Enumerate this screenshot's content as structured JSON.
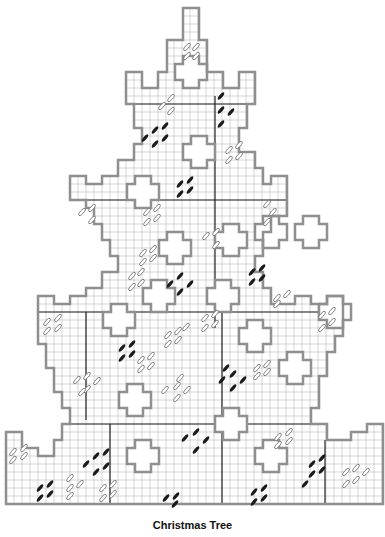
{
  "title": "Christmas Tree",
  "grid": {
    "cell": 8,
    "line_color": "#b9b9b9",
    "outline_color": "#8f8f8f",
    "divider_color": "#222222"
  },
  "stitch_colors": {
    "light": "#7a7a7a",
    "dark": "#1a1a1a"
  },
  "outline_points": [
    [
      183,
      8
    ],
    [
      199,
      8
    ],
    [
      199,
      40
    ],
    [
      207,
      40
    ],
    [
      207,
      72
    ],
    [
      223,
      72
    ],
    [
      223,
      88
    ],
    [
      239,
      88
    ],
    [
      239,
      72
    ],
    [
      255,
      72
    ],
    [
      255,
      104
    ],
    [
      247,
      104
    ],
    [
      247,
      128
    ],
    [
      239,
      128
    ],
    [
      239,
      152
    ],
    [
      255,
      152
    ],
    [
      255,
      168
    ],
    [
      263,
      168
    ],
    [
      263,
      184
    ],
    [
      271,
      184
    ],
    [
      271,
      176
    ],
    [
      287,
      176
    ],
    [
      287,
      216
    ],
    [
      271,
      216
    ],
    [
      271,
      232
    ],
    [
      263,
      232
    ],
    [
      263,
      256
    ],
    [
      255,
      256
    ],
    [
      255,
      272
    ],
    [
      263,
      272
    ],
    [
      263,
      288
    ],
    [
      271,
      288
    ],
    [
      271,
      304
    ],
    [
      295,
      304
    ],
    [
      295,
      296
    ],
    [
      311,
      296
    ],
    [
      311,
      304
    ],
    [
      327,
      304
    ],
    [
      327,
      296
    ],
    [
      343,
      296
    ],
    [
      343,
      336
    ],
    [
      335,
      336
    ],
    [
      335,
      352
    ],
    [
      327,
      352
    ],
    [
      327,
      376
    ],
    [
      319,
      376
    ],
    [
      319,
      408
    ],
    [
      311,
      408
    ],
    [
      311,
      424
    ],
    [
      327,
      424
    ],
    [
      327,
      440
    ],
    [
      351,
      440
    ],
    [
      351,
      432
    ],
    [
      367,
      432
    ],
    [
      367,
      424
    ],
    [
      383,
      424
    ],
    [
      383,
      504
    ],
    [
      6,
      504
    ],
    [
      6,
      432
    ],
    [
      22,
      432
    ],
    [
      22,
      448
    ],
    [
      38,
      448
    ],
    [
      38,
      456
    ],
    [
      54,
      456
    ],
    [
      54,
      440
    ],
    [
      62,
      440
    ],
    [
      62,
      424
    ],
    [
      70,
      424
    ],
    [
      70,
      408
    ],
    [
      62,
      408
    ],
    [
      62,
      392
    ],
    [
      54,
      392
    ],
    [
      54,
      368
    ],
    [
      46,
      368
    ],
    [
      46,
      344
    ],
    [
      38,
      344
    ],
    [
      38,
      296
    ],
    [
      54,
      296
    ],
    [
      54,
      304
    ],
    [
      70,
      304
    ],
    [
      70,
      296
    ],
    [
      86,
      296
    ],
    [
      86,
      288
    ],
    [
      102,
      288
    ],
    [
      102,
      272
    ],
    [
      118,
      272
    ],
    [
      118,
      256
    ],
    [
      110,
      256
    ],
    [
      110,
      240
    ],
    [
      102,
      240
    ],
    [
      102,
      224
    ],
    [
      94,
      224
    ],
    [
      94,
      208
    ],
    [
      86,
      208
    ],
    [
      86,
      200
    ],
    [
      70,
      200
    ],
    [
      70,
      176
    ],
    [
      86,
      176
    ],
    [
      86,
      184
    ],
    [
      102,
      184
    ],
    [
      102,
      176
    ],
    [
      118,
      176
    ],
    [
      118,
      160
    ],
    [
      134,
      160
    ],
    [
      134,
      144
    ],
    [
      142,
      144
    ],
    [
      142,
      128
    ],
    [
      134,
      128
    ],
    [
      134,
      104
    ],
    [
      126,
      104
    ],
    [
      126,
      72
    ],
    [
      142,
      72
    ],
    [
      142,
      88
    ],
    [
      158,
      88
    ],
    [
      158,
      72
    ],
    [
      167,
      72
    ],
    [
      167,
      40
    ],
    [
      183,
      40
    ]
  ],
  "crosses": [
    [
      191,
      72
    ],
    [
      199,
      152
    ],
    [
      231,
      240
    ],
    [
      143,
      192
    ],
    [
      271,
      232
    ],
    [
      175,
      248
    ],
    [
      119,
      320
    ],
    [
      159,
      296
    ],
    [
      255,
      336
    ],
    [
      295,
      368
    ],
    [
      223,
      296
    ],
    [
      135,
      400
    ],
    [
      143,
      456
    ],
    [
      271,
      456
    ],
    [
      231,
      424
    ],
    [
      311,
      232
    ],
    [
      335,
      312
    ]
  ],
  "dividers": [
    [
      [
        126,
        104
      ],
      [
        255,
        104
      ]
    ],
    [
      [
        215,
        96
      ],
      [
        215,
        328
      ]
    ],
    [
      [
        70,
        200
      ],
      [
        287,
        200
      ]
    ],
    [
      [
        38,
        312
      ],
      [
        343,
        312
      ]
    ],
    [
      [
        86,
        312
      ],
      [
        86,
        420
      ]
    ],
    [
      [
        222,
        312
      ],
      [
        222,
        504
      ]
    ],
    [
      [
        70,
        424
      ],
      [
        311,
        424
      ]
    ],
    [
      [
        110,
        424
      ],
      [
        110,
        504
      ]
    ],
    [
      [
        325,
        440
      ],
      [
        325,
        504
      ]
    ]
  ],
  "stitches_light": [
    [
      187,
      47
    ],
    [
      196,
      47
    ],
    [
      187,
      56
    ],
    [
      196,
      56
    ],
    [
      162,
      106
    ],
    [
      171,
      98
    ],
    [
      171,
      111
    ],
    [
      229,
      150
    ],
    [
      239,
      145
    ],
    [
      229,
      160
    ],
    [
      239,
      156
    ],
    [
      82,
      212
    ],
    [
      92,
      208
    ],
    [
      92,
      220
    ],
    [
      147,
      212
    ],
    [
      157,
      208
    ],
    [
      147,
      222
    ],
    [
      157,
      218
    ],
    [
      216,
      232
    ],
    [
      206,
      236
    ],
    [
      216,
      245
    ],
    [
      267,
      204
    ],
    [
      273,
      212
    ],
    [
      267,
      222
    ],
    [
      143,
      253
    ],
    [
      153,
      249
    ],
    [
      143,
      262
    ],
    [
      153,
      258
    ],
    [
      132,
      276
    ],
    [
      141,
      272
    ],
    [
      132,
      287
    ],
    [
      141,
      283
    ],
    [
      47,
      322
    ],
    [
      58,
      318
    ],
    [
      47,
      331
    ],
    [
      58,
      328
    ],
    [
      168,
      335
    ],
    [
      178,
      331
    ],
    [
      168,
      344
    ],
    [
      178,
      340
    ],
    [
      186,
      327
    ],
    [
      205,
      318
    ],
    [
      215,
      314
    ],
    [
      205,
      328
    ],
    [
      215,
      324
    ],
    [
      277,
      298
    ],
    [
      287,
      294
    ],
    [
      277,
      304
    ],
    [
      322,
      315
    ],
    [
      332,
      311
    ],
    [
      332,
      322
    ],
    [
      322,
      328
    ],
    [
      77,
      380
    ],
    [
      87,
      376
    ],
    [
      87,
      389
    ],
    [
      97,
      381
    ],
    [
      82,
      392
    ],
    [
      141,
      360
    ],
    [
      151,
      356
    ],
    [
      141,
      369
    ],
    [
      151,
      366
    ],
    [
      165,
      390
    ],
    [
      177,
      386
    ],
    [
      187,
      390
    ],
    [
      177,
      398
    ],
    [
      180,
      378
    ],
    [
      257,
      368
    ],
    [
      267,
      364
    ],
    [
      257,
      376
    ],
    [
      267,
      372
    ],
    [
      278,
      437
    ],
    [
      289,
      432
    ],
    [
      278,
      445
    ],
    [
      289,
      441
    ],
    [
      13,
      452
    ],
    [
      24,
      448
    ],
    [
      13,
      460
    ],
    [
      24,
      456
    ],
    [
      70,
      478
    ],
    [
      70,
      488
    ],
    [
      80,
      484
    ],
    [
      70,
      496
    ],
    [
      103,
      488
    ],
    [
      113,
      484
    ],
    [
      103,
      498
    ],
    [
      113,
      494
    ],
    [
      346,
      472
    ],
    [
      356,
      468
    ],
    [
      366,
      472
    ],
    [
      356,
      480
    ],
    [
      346,
      484
    ]
  ],
  "stitches_dark": [
    [
      221,
      96
    ],
    [
      221,
      110
    ],
    [
      221,
      124
    ],
    [
      231,
      112
    ],
    [
      155,
      130
    ],
    [
      165,
      126
    ],
    [
      145,
      138
    ],
    [
      155,
      144
    ],
    [
      165,
      138
    ],
    [
      180,
      184
    ],
    [
      190,
      180
    ],
    [
      180,
      194
    ],
    [
      190,
      190
    ],
    [
      170,
      284
    ],
    [
      180,
      276
    ],
    [
      190,
      284
    ],
    [
      180,
      292
    ],
    [
      252,
      272
    ],
    [
      262,
      268
    ],
    [
      252,
      282
    ],
    [
      262,
      278
    ],
    [
      122,
      348
    ],
    [
      132,
      344
    ],
    [
      122,
      358
    ],
    [
      132,
      354
    ],
    [
      222,
      380
    ],
    [
      233,
      374
    ],
    [
      243,
      380
    ],
    [
      233,
      388
    ],
    [
      226,
      368
    ],
    [
      185,
      438
    ],
    [
      196,
      432
    ],
    [
      206,
      440
    ],
    [
      196,
      450
    ],
    [
      96,
      456
    ],
    [
      106,
      452
    ],
    [
      86,
      464
    ],
    [
      96,
      472
    ],
    [
      106,
      466
    ],
    [
      40,
      488
    ],
    [
      50,
      484
    ],
    [
      40,
      498
    ],
    [
      50,
      494
    ],
    [
      166,
      498
    ],
    [
      176,
      496
    ],
    [
      175,
      504
    ],
    [
      254,
      492
    ],
    [
      264,
      488
    ],
    [
      254,
      502
    ],
    [
      264,
      498
    ],
    [
      312,
      464
    ],
    [
      322,
      458
    ],
    [
      312,
      474
    ],
    [
      322,
      470
    ],
    [
      305,
      484
    ]
  ]
}
